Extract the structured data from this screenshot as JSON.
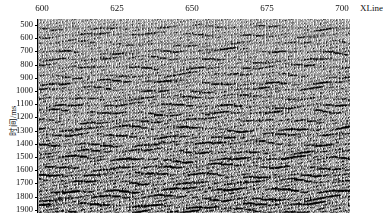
{
  "figure": {
    "type": "seismic-section",
    "background": "#ffffff",
    "ink": "#000000"
  },
  "xaxis": {
    "title": "XLine",
    "ticks": [
      600,
      625,
      650,
      675,
      700
    ],
    "tick_labels": [
      "600",
      "625",
      "650",
      "675",
      "700"
    ],
    "range": [
      595,
      702
    ],
    "position": "top"
  },
  "yaxis": {
    "title": "时间/ms",
    "ticks": [
      500,
      600,
      700,
      800,
      900,
      1000,
      1100,
      1200,
      1300,
      1400,
      1500,
      1600,
      1700,
      1800,
      1900
    ],
    "tick_labels": [
      "500",
      "600",
      "700",
      "800",
      "900",
      "1000",
      "1100",
      "1200",
      "1300",
      "1400",
      "1500",
      "1600",
      "1700",
      "1800",
      "1900"
    ],
    "range": [
      480,
      1950
    ],
    "direction": "down"
  },
  "chart_data": {
    "type": "line",
    "title": "",
    "subtitle": "",
    "xlabel": "XLine",
    "ylabel": "时间/ms",
    "xlim": [
      595,
      702
    ],
    "ylim": [
      1950,
      480
    ],
    "grid": false,
    "legend": null,
    "display_style": "variable-area wiggle",
    "trace_count": 214,
    "trace_spacing_xline": 0.5,
    "sample_interval_ms": 2,
    "annotations": [],
    "reflector_bands_ms": [
      520,
      575,
      640,
      700,
      760,
      820,
      880,
      935,
      990,
      1050,
      1110,
      1165,
      1225,
      1285,
      1340,
      1400,
      1460,
      1515,
      1575,
      1635,
      1690,
      1750,
      1810,
      1865,
      1915
    ],
    "band_amplitude": [
      0.55,
      0.62,
      0.48,
      0.71,
      0.58,
      0.66,
      0.52,
      0.74,
      0.61,
      0.57,
      0.69,
      0.63,
      0.55,
      0.78,
      0.66,
      0.72,
      0.6,
      0.81,
      0.68,
      0.74,
      0.63,
      0.85,
      0.7,
      0.77,
      0.66
    ]
  }
}
